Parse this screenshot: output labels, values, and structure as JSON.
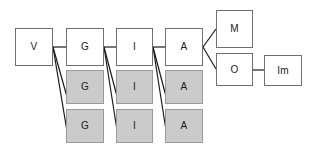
{
  "diagram": {
    "colors": {
      "canvas": "#ffffff",
      "plain_fill": "#ffffff",
      "plain_border": "#6e6e6e",
      "shaded_fill": "#cbcbcb",
      "shaded_border": "#9a9a9a",
      "edge": "#1a1a1a",
      "label": "#1a1a1a"
    },
    "nodes": [
      {
        "id": "v",
        "label": "V",
        "style": "plain",
        "x": 15,
        "y": 28,
        "w": 38,
        "h": 38
      },
      {
        "id": "g1",
        "label": "G",
        "style": "plain",
        "x": 66,
        "y": 28,
        "w": 38,
        "h": 38
      },
      {
        "id": "i1",
        "label": "I",
        "style": "plain",
        "x": 116,
        "y": 28,
        "w": 37,
        "h": 38
      },
      {
        "id": "a1",
        "label": "A",
        "style": "plain",
        "x": 165,
        "y": 28,
        "w": 38,
        "h": 38
      },
      {
        "id": "m",
        "label": "M",
        "style": "plain",
        "x": 216,
        "y": 10,
        "w": 37,
        "h": 38
      },
      {
        "id": "o",
        "label": "O",
        "style": "plain",
        "x": 216,
        "y": 53,
        "w": 37,
        "h": 33
      },
      {
        "id": "im",
        "label": "Im",
        "style": "plain",
        "x": 264,
        "y": 55,
        "w": 38,
        "h": 31
      },
      {
        "id": "g2",
        "label": "G",
        "style": "shaded",
        "x": 66,
        "y": 70,
        "w": 38,
        "h": 34
      },
      {
        "id": "i2",
        "label": "I",
        "style": "shaded",
        "x": 116,
        "y": 70,
        "w": 37,
        "h": 34
      },
      {
        "id": "a2",
        "label": "A",
        "style": "shaded",
        "x": 165,
        "y": 70,
        "w": 38,
        "h": 34
      },
      {
        "id": "g3",
        "label": "G",
        "style": "shaded",
        "x": 66,
        "y": 109,
        "w": 38,
        "h": 34
      },
      {
        "id": "i3",
        "label": "I",
        "style": "shaded",
        "x": 116,
        "y": 109,
        "w": 37,
        "h": 34
      },
      {
        "id": "a3",
        "label": "A",
        "style": "shaded",
        "x": 165,
        "y": 109,
        "w": 38,
        "h": 34
      }
    ],
    "edges": [
      {
        "id": "v-g1",
        "from": "v",
        "to": "g1",
        "x1": 53,
        "y1": 47,
        "x2": 66,
        "y2": 47
      },
      {
        "id": "v-g2",
        "from": "v",
        "to": "g2",
        "x1": 53,
        "y1": 47,
        "x2": 69,
        "y2": 104
      },
      {
        "id": "v-g3",
        "from": "v",
        "to": "g3",
        "x1": 53,
        "y1": 47,
        "x2": 69,
        "y2": 143
      },
      {
        "id": "g1-i1",
        "from": "g1",
        "to": "i1",
        "x1": 104,
        "y1": 47,
        "x2": 116,
        "y2": 47
      },
      {
        "id": "g1-i2",
        "from": "g1",
        "to": "i2",
        "x1": 104,
        "y1": 47,
        "x2": 119,
        "y2": 104
      },
      {
        "id": "g1-i3",
        "from": "g1",
        "to": "i3",
        "x1": 104,
        "y1": 47,
        "x2": 119,
        "y2": 143
      },
      {
        "id": "i1-a1",
        "from": "i1",
        "to": "a1",
        "x1": 153,
        "y1": 47,
        "x2": 165,
        "y2": 47
      },
      {
        "id": "i1-a2",
        "from": "i1",
        "to": "a2",
        "x1": 153,
        "y1": 47,
        "x2": 168,
        "y2": 104
      },
      {
        "id": "i1-a3",
        "from": "i1",
        "to": "a3",
        "x1": 153,
        "y1": 47,
        "x2": 168,
        "y2": 143
      },
      {
        "id": "a1-m",
        "from": "a1",
        "to": "m",
        "x1": 203,
        "y1": 47,
        "x2": 216,
        "y2": 29
      },
      {
        "id": "a1-o",
        "from": "a1",
        "to": "o",
        "x1": 203,
        "y1": 47,
        "x2": 216,
        "y2": 69
      },
      {
        "id": "o-im",
        "from": "o",
        "to": "im",
        "x1": 253,
        "y1": 70,
        "x2": 264,
        "y2": 70
      }
    ]
  }
}
